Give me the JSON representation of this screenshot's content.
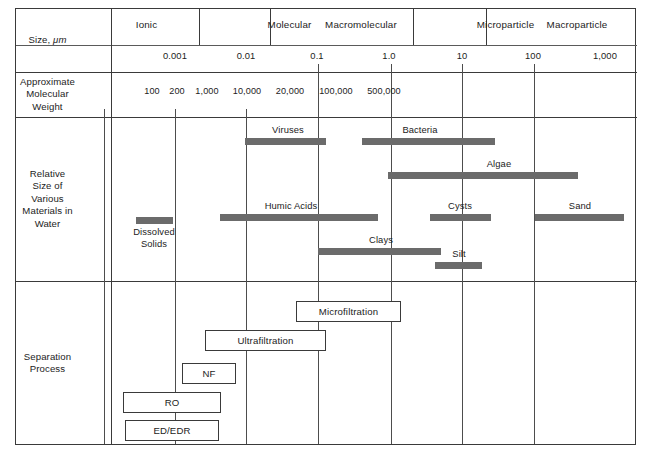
{
  "figure": {
    "row_labels": [
      {
        "id": "size",
        "lines": [
          "Size, μm"
        ]
      },
      {
        "id": "molweight",
        "lines": [
          "Approximate",
          "Molecular",
          "Weight"
        ]
      },
      {
        "id": "relsize",
        "lines": [
          "Relative",
          "Size of",
          "Various",
          "Materials in",
          "Water"
        ]
      },
      {
        "id": "separation",
        "lines": [
          "Separation",
          "Process"
        ]
      }
    ],
    "size_categories": [
      {
        "label": "Ionic",
        "x": 146.5
      },
      {
        "label": "Molecular",
        "x": 289.5
      },
      {
        "label": "Macromolecular",
        "x": 361.0
      },
      {
        "label": "Microparticle",
        "x": 505.5
      },
      {
        "label": "Macroparticle",
        "x": 577.0
      }
    ],
    "scale_ticks": [
      {
        "label": "0.001",
        "x": 183
      },
      {
        "label": "0.01",
        "x": 254
      },
      {
        "label": "0.1",
        "x": 325
      },
      {
        "label": "1.0",
        "x": 397
      },
      {
        "label": "10",
        "x": 470
      },
      {
        "label": "100",
        "x": 541
      },
      {
        "label": "1,000",
        "x": 613
      }
    ],
    "molecular_weights": [
      {
        "label": "100",
        "x": 152
      },
      {
        "label": "200",
        "x": 177
      },
      {
        "label": "1,000",
        "x": 207
      },
      {
        "label": "10,000",
        "x": 247
      },
      {
        "label": "20,000",
        "x": 290
      },
      {
        "label": "100,000",
        "x": 336
      },
      {
        "label": "500,000",
        "x": 384
      }
    ],
    "materials": [
      {
        "name": "Dissolved Solids",
        "bar_x": 136,
        "bar_w": 37,
        "bar_y": 217,
        "label_lines": [
          "Dissolved",
          "Solids"
        ],
        "label_x": 154,
        "label_y": 226
      },
      {
        "name": "Viruses",
        "bar_x": 245,
        "bar_w": 81,
        "bar_y": 138,
        "label_lines": [
          "Viruses"
        ],
        "label_x": 288,
        "label_y": 124
      },
      {
        "name": "Bacteria",
        "bar_x": 362,
        "bar_w": 133,
        "bar_y": 138,
        "label_lines": [
          "Bacteria"
        ],
        "label_x": 420,
        "label_y": 124
      },
      {
        "name": "Algae",
        "bar_x": 388,
        "bar_w": 190,
        "bar_y": 172,
        "label_lines": [
          "Algae"
        ],
        "label_x": 499,
        "label_y": 158
      },
      {
        "name": "Humic Acids",
        "bar_x": 220,
        "bar_w": 158,
        "bar_y": 214,
        "label_lines": [
          "Humic Acids"
        ],
        "label_x": 291,
        "label_y": 200
      },
      {
        "name": "Cysts",
        "bar_x": 430,
        "bar_w": 61,
        "bar_y": 214,
        "label_lines": [
          "Cysts"
        ],
        "label_x": 460,
        "label_y": 200
      },
      {
        "name": "Sand",
        "bar_x": 535,
        "bar_w": 89,
        "bar_y": 214,
        "label_lines": [
          "Sand"
        ],
        "label_x": 580,
        "label_y": 200
      },
      {
        "name": "Clays",
        "bar_x": 318,
        "bar_w": 123,
        "bar_y": 248,
        "label_lines": [
          "Clays"
        ],
        "label_x": 381,
        "label_y": 234
      },
      {
        "name": "Silt",
        "bar_x": 435,
        "bar_w": 47,
        "bar_y": 262,
        "label_lines": [
          "Silt"
        ],
        "label_x": 459,
        "label_y": 248
      }
    ],
    "separation_processes": [
      {
        "label": "Microfiltration",
        "x": 296,
        "y": 301,
        "w": 105,
        "h": 21
      },
      {
        "label": "Ultrafiltration",
        "x": 205,
        "y": 330,
        "w": 121,
        "h": 21
      },
      {
        "label": "NF",
        "x": 182,
        "y": 363,
        "w": 54,
        "h": 21
      },
      {
        "label": "RO",
        "x": 123,
        "y": 392,
        "w": 98,
        "h": 21
      },
      {
        "label": "ED/EDR",
        "x": 125,
        "y": 420,
        "w": 94,
        "h": 21
      }
    ],
    "gridlines_x": [
      183,
      254,
      325,
      397,
      470,
      541,
      613
    ],
    "colors": {
      "bar": "#6b6b6b",
      "rule": "#3a3a3a",
      "text": "#1c1c1c"
    }
  }
}
